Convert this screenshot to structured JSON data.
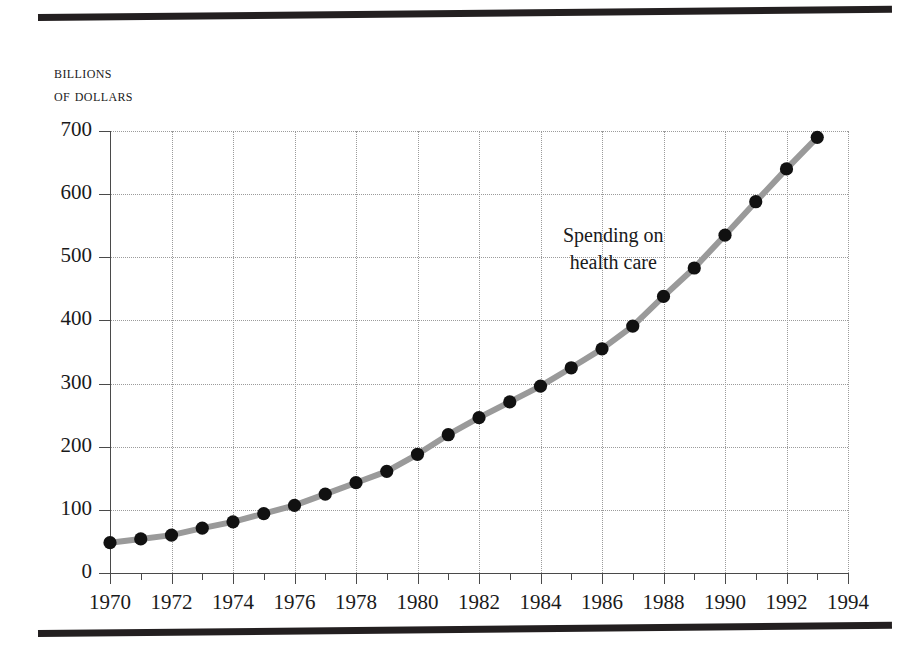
{
  "figure": {
    "axis_caption_line1": "Billions",
    "axis_caption_line2": "of dollars",
    "annotation_line1": "Spending on",
    "annotation_line2": "health care",
    "line_color": "#9a9a9a",
    "marker_color": "#111111",
    "grid_color": "#9b9b9b",
    "rule_color": "#231f20"
  },
  "chart_data": {
    "type": "line",
    "title": "",
    "xlabel": "",
    "ylabel": "Billions of dollars",
    "xlim": [
      1970,
      1994
    ],
    "ylim": [
      0,
      700
    ],
    "grid": true,
    "legend": false,
    "annotations": [
      {
        "text": "Spending on health care",
        "x": 1988,
        "y": 520
      }
    ],
    "y_ticks": [
      0,
      100,
      200,
      300,
      400,
      500,
      600,
      700
    ],
    "y_tick_labels": [
      "0",
      "100",
      "200",
      "300",
      "400",
      "500",
      "600",
      "700"
    ],
    "x_ticks": [
      1970,
      1972,
      1974,
      1976,
      1978,
      1980,
      1982,
      1984,
      1986,
      1988,
      1990,
      1992,
      1994
    ],
    "x_tick_labels": [
      "1970",
      "1972",
      "1974",
      "1976",
      "1978",
      "1980",
      "1982",
      "1984",
      "1986",
      "1988",
      "1990",
      "1992",
      "1994"
    ],
    "x_minor_ticks": [
      1971,
      1973,
      1975,
      1977,
      1979,
      1981,
      1983,
      1985,
      1987,
      1989,
      1991,
      1993
    ],
    "series": [
      {
        "name": "Spending on health care",
        "x": [
          1970,
          1971,
          1972,
          1973,
          1974,
          1975,
          1976,
          1977,
          1978,
          1979,
          1980,
          1981,
          1982,
          1983,
          1984,
          1985,
          1986,
          1987,
          1988,
          1989,
          1990,
          1991,
          1992,
          1993
        ],
        "values": [
          48,
          54,
          60,
          71,
          81,
          94,
          107,
          125,
          143,
          161,
          188,
          219,
          246,
          271,
          296,
          325,
          355,
          391,
          438,
          483,
          535,
          588,
          640,
          690
        ]
      }
    ]
  }
}
